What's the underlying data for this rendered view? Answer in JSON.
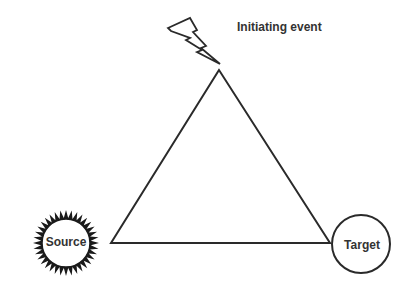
{
  "diagram": {
    "type": "triangle-relationship",
    "labels": {
      "initiating_event": "Initiating event",
      "source": "Source",
      "target": "Target"
    },
    "nodes": [
      {
        "id": "initiating-event",
        "shape": "lightning-bolt",
        "label": "Initiating event"
      },
      {
        "id": "source",
        "shape": "sun-starburst",
        "label": "Source"
      },
      {
        "id": "target",
        "shape": "circle",
        "label": "Target"
      }
    ],
    "edges": [
      {
        "from": "initiating-event",
        "to": "source"
      },
      {
        "from": "initiating-event",
        "to": "target"
      },
      {
        "from": "source",
        "to": "target"
      }
    ],
    "colors": {
      "stroke": "#2a2a2a",
      "fill": "#ffffff",
      "text": "#333333"
    }
  }
}
